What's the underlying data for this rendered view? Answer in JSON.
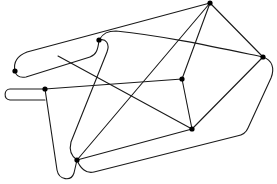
{
  "diagram": {
    "type": "graph",
    "directed": false,
    "background": "#ffffff",
    "edge_color": "#1a1a1a",
    "node_color": "#000000",
    "node_radius": 2.6,
    "nodes": [
      {
        "id": "A",
        "x": 210,
        "y": 3
      },
      {
        "id": "B",
        "x": 263,
        "y": 57
      },
      {
        "id": "C",
        "x": 99,
        "y": 40
      },
      {
        "id": "D",
        "x": 15,
        "y": 71
      },
      {
        "id": "E",
        "x": 45,
        "y": 89
      },
      {
        "id": "F",
        "x": 182,
        "y": 79
      },
      {
        "id": "G",
        "x": 192,
        "y": 129
      },
      {
        "id": "H",
        "x": 77,
        "y": 160
      }
    ],
    "edges": [
      {
        "id": "A-B",
        "d": "M210,3 L263,57"
      },
      {
        "id": "A-F",
        "d": "M210,3 L182,79"
      },
      {
        "id": "A-H",
        "d": "M210,3 L77,160"
      },
      {
        "id": "D-A",
        "d": "M15,71 C14,60 18,54 28,51 L210,3"
      },
      {
        "id": "C-B",
        "d": "M99,40 C104,33 108,31 118,31 C160,35 210,46 263,57"
      },
      {
        "id": "B-H-loop",
        "d": "M263,57 C273,60 276,68 272,78 L248,130 C246,134 243,135 238,136 L95,173 C86,175 80,170 77,160"
      },
      {
        "id": "F-E",
        "d": "M182,79 L45,89"
      },
      {
        "id": "F-G",
        "d": "M182,79 L192,129"
      },
      {
        "id": "B-G",
        "d": "M263,57 L192,129"
      },
      {
        "id": "G-H",
        "d": "M192,129 L77,160"
      },
      {
        "id": "D-C",
        "d": "M15,71 C16,76 20,78 26,77 L92,56 C97,54 99,50 99,40"
      },
      {
        "id": "mid-G",
        "d": "M58,56 L192,129"
      },
      {
        "id": "D-mid",
        "d": "M15,71 L58,56"
      },
      {
        "id": "C-H",
        "d": "M99,40 C106,38 110,44 107,52 L72,142 C70,150 72,156 77,160"
      },
      {
        "id": "E-H",
        "d": "M45,89 C38,89 34,88 28,89 C10,90 8,100 24,101 L45,100 M45,89 L58,172 C60,180 70,182 74,174 C77,168 78,164 77,160"
      }
    ]
  }
}
